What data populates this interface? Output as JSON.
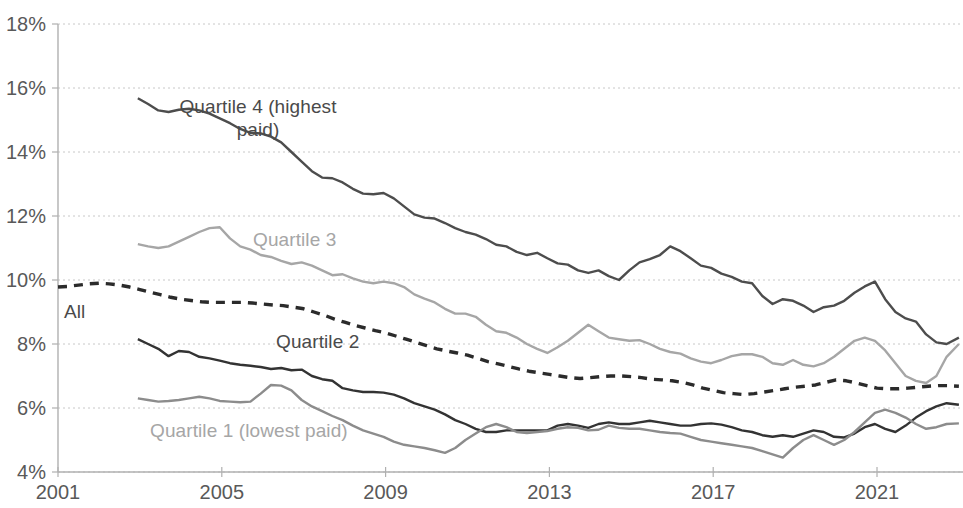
{
  "chart_data": {
    "type": "line",
    "title": "",
    "subtitle": "",
    "xlabel": "",
    "ylabel": "",
    "xlim": [
      2001,
      2023.1
    ],
    "ylim": [
      4,
      18
    ],
    "y_tick_labels": [
      "18%",
      "16%",
      "14%",
      "12%",
      "10%",
      "8%",
      "6%",
      "4%"
    ],
    "y_tick_values": [
      18,
      16,
      14,
      12,
      10,
      8,
      6,
      4
    ],
    "x_tick_labels": [
      "2001",
      "2005",
      "2009",
      "2013",
      "2017",
      "2021"
    ],
    "x_tick_values": [
      2001,
      2005,
      2009,
      2013,
      2017,
      2021
    ],
    "grid": "horizontal-dotted",
    "legend": "inline-labels",
    "colors": {
      "all": "#2b2b2b",
      "quartile_4": "#4d4d4d",
      "quartile_3": "#a6a6a6",
      "quartile_2": "#333333",
      "quartile_1": "#8c8c8c",
      "gridline": "#c8c8c8",
      "axis": "#b0b0b0",
      "tick_text": "#595959",
      "background": "#ffffff"
    },
    "series": [
      {
        "name": "All",
        "label": "All",
        "style": "dashed",
        "color": "#2b2b2b",
        "x": [
          2001,
          2001.25,
          2001.5,
          2001.75,
          2002,
          2002.25,
          2002.5,
          2002.75,
          2003,
          2003.25,
          2003.5,
          2003.75,
          2004,
          2004.25,
          2004.5,
          2004.75,
          2005,
          2005.25,
          2005.5,
          2005.75,
          2006,
          2006.25,
          2006.5,
          2006.75,
          2007,
          2007.25,
          2007.5,
          2007.75,
          2008,
          2008.25,
          2008.5,
          2008.75,
          2009,
          2009.25,
          2009.5,
          2009.75,
          2010,
          2010.25,
          2010.5,
          2010.75,
          2011,
          2011.25,
          2011.5,
          2011.75,
          2012,
          2012.25,
          2012.5,
          2012.75,
          2013,
          2013.25,
          2013.5,
          2013.75,
          2014,
          2014.25,
          2014.5,
          2014.75,
          2015,
          2015.25,
          2015.5,
          2015.75,
          2016,
          2016.25,
          2016.5,
          2016.75,
          2017,
          2017.25,
          2017.5,
          2017.75,
          2018,
          2018.25,
          2018.5,
          2018.75,
          2019,
          2019.25,
          2019.5,
          2019.75,
          2020,
          2020.25,
          2020.5,
          2020.75,
          2021,
          2021.25,
          2021.5,
          2021.75,
          2022,
          2022.25,
          2022.5,
          2022.75,
          2023
        ],
        "y": [
          9.78,
          9.8,
          9.84,
          9.88,
          9.9,
          9.88,
          9.84,
          9.78,
          9.7,
          9.62,
          9.54,
          9.46,
          9.4,
          9.36,
          9.32,
          9.3,
          9.3,
          9.3,
          9.3,
          9.28,
          9.25,
          9.22,
          9.2,
          9.15,
          9.1,
          9.0,
          8.9,
          8.78,
          8.68,
          8.58,
          8.5,
          8.42,
          8.35,
          8.25,
          8.15,
          8.05,
          7.95,
          7.85,
          7.78,
          7.72,
          7.65,
          7.55,
          7.45,
          7.38,
          7.3,
          7.22,
          7.15,
          7.1,
          7.05,
          7.0,
          6.95,
          6.92,
          6.95,
          6.98,
          7.0,
          7.0,
          6.98,
          6.95,
          6.9,
          6.88,
          6.85,
          6.8,
          6.72,
          6.62,
          6.55,
          6.48,
          6.45,
          6.42,
          6.45,
          6.5,
          6.55,
          6.6,
          6.65,
          6.68,
          6.72,
          6.8,
          6.88,
          6.85,
          6.78,
          6.7,
          6.62,
          6.6,
          6.6,
          6.62,
          6.65,
          6.68,
          6.7,
          6.7,
          6.68
        ]
      },
      {
        "name": "Quartile 4 (highest paid)",
        "label": "Quartile 4 (highest\npaid)",
        "style": "solid",
        "color": "#4d4d4d",
        "x": [
          2002.95,
          2003.2,
          2003.45,
          2003.7,
          2003.95,
          2004.2,
          2004.45,
          2004.7,
          2004.95,
          2005.2,
          2005.45,
          2005.7,
          2005.95,
          2006.2,
          2006.45,
          2006.7,
          2006.95,
          2007.2,
          2007.45,
          2007.7,
          2007.95,
          2008.2,
          2008.45,
          2008.7,
          2008.95,
          2009.2,
          2009.45,
          2009.7,
          2009.95,
          2010.2,
          2010.45,
          2010.7,
          2010.95,
          2011.2,
          2011.45,
          2011.7,
          2011.95,
          2012.2,
          2012.45,
          2012.7,
          2012.95,
          2013.2,
          2013.45,
          2013.7,
          2013.95,
          2014.2,
          2014.45,
          2014.7,
          2014.95,
          2015.2,
          2015.45,
          2015.7,
          2015.95,
          2016.2,
          2016.45,
          2016.7,
          2016.95,
          2017.2,
          2017.45,
          2017.7,
          2017.95,
          2018.2,
          2018.45,
          2018.7,
          2018.95,
          2019.2,
          2019.45,
          2019.7,
          2019.95,
          2020.2,
          2020.45,
          2020.7,
          2020.95,
          2021.2,
          2021.45,
          2021.7,
          2021.95,
          2022.2,
          2022.45,
          2022.7,
          2023
        ],
        "y": [
          15.68,
          15.5,
          15.3,
          15.25,
          15.32,
          15.35,
          15.3,
          15.2,
          15.05,
          14.9,
          14.72,
          14.6,
          14.58,
          14.48,
          14.3,
          14.0,
          13.7,
          13.4,
          13.2,
          13.18,
          13.05,
          12.85,
          12.7,
          12.68,
          12.72,
          12.55,
          12.3,
          12.05,
          11.95,
          11.92,
          11.78,
          11.62,
          11.5,
          11.42,
          11.28,
          11.1,
          11.05,
          10.88,
          10.78,
          10.85,
          10.68,
          10.52,
          10.48,
          10.3,
          10.22,
          10.3,
          10.12,
          10.0,
          10.3,
          10.55,
          10.65,
          10.78,
          11.05,
          10.9,
          10.68,
          10.45,
          10.38,
          10.2,
          10.1,
          9.95,
          9.9,
          9.5,
          9.25,
          9.4,
          9.35,
          9.2,
          9.0,
          9.15,
          9.2,
          9.35,
          9.6,
          9.8,
          9.95,
          9.4,
          9.0,
          8.8,
          8.7,
          8.3,
          8.05,
          8.0,
          8.2
        ]
      },
      {
        "name": "Quartile 3",
        "label": "Quartile 3",
        "style": "solid",
        "color": "#a6a6a6",
        "x": [
          2002.95,
          2003.2,
          2003.45,
          2003.7,
          2003.95,
          2004.2,
          2004.45,
          2004.7,
          2004.95,
          2005.2,
          2005.45,
          2005.7,
          2005.95,
          2006.2,
          2006.45,
          2006.7,
          2006.95,
          2007.2,
          2007.45,
          2007.7,
          2007.95,
          2008.2,
          2008.45,
          2008.7,
          2008.95,
          2009.2,
          2009.45,
          2009.7,
          2009.95,
          2010.2,
          2010.45,
          2010.7,
          2010.95,
          2011.2,
          2011.45,
          2011.7,
          2011.95,
          2012.2,
          2012.45,
          2012.7,
          2012.95,
          2013.2,
          2013.45,
          2013.7,
          2013.95,
          2014.2,
          2014.45,
          2014.7,
          2014.95,
          2015.2,
          2015.45,
          2015.7,
          2015.95,
          2016.2,
          2016.45,
          2016.7,
          2016.95,
          2017.2,
          2017.45,
          2017.7,
          2017.95,
          2018.2,
          2018.45,
          2018.7,
          2018.95,
          2019.2,
          2019.45,
          2019.7,
          2019.95,
          2020.2,
          2020.45,
          2020.7,
          2020.95,
          2021.2,
          2021.45,
          2021.7,
          2021.95,
          2022.2,
          2022.45,
          2022.7,
          2023
        ],
        "y": [
          11.12,
          11.05,
          11.0,
          11.05,
          11.2,
          11.35,
          11.5,
          11.62,
          11.65,
          11.3,
          11.05,
          10.95,
          10.78,
          10.72,
          10.6,
          10.5,
          10.55,
          10.45,
          10.3,
          10.15,
          10.18,
          10.05,
          9.95,
          9.9,
          9.95,
          9.9,
          9.78,
          9.55,
          9.42,
          9.3,
          9.1,
          8.95,
          8.95,
          8.85,
          8.6,
          8.4,
          8.35,
          8.2,
          8.0,
          7.85,
          7.72,
          7.9,
          8.1,
          8.35,
          8.6,
          8.4,
          8.2,
          8.15,
          8.1,
          8.12,
          8.0,
          7.85,
          7.75,
          7.7,
          7.55,
          7.45,
          7.4,
          7.5,
          7.62,
          7.68,
          7.68,
          7.6,
          7.4,
          7.35,
          7.5,
          7.35,
          7.3,
          7.4,
          7.6,
          7.85,
          8.1,
          8.2,
          8.1,
          7.8,
          7.4,
          7.0,
          6.85,
          6.78,
          7.0,
          7.6,
          8.0
        ]
      },
      {
        "name": "Quartile 2",
        "label": "Quartile 2",
        "style": "solid",
        "color": "#333333",
        "x": [
          2002.95,
          2003.2,
          2003.45,
          2003.7,
          2003.95,
          2004.2,
          2004.45,
          2004.7,
          2004.95,
          2005.2,
          2005.45,
          2005.7,
          2005.95,
          2006.2,
          2006.45,
          2006.7,
          2006.95,
          2007.2,
          2007.45,
          2007.7,
          2007.95,
          2008.2,
          2008.45,
          2008.7,
          2008.95,
          2009.2,
          2009.45,
          2009.7,
          2009.95,
          2010.2,
          2010.45,
          2010.7,
          2010.95,
          2011.2,
          2011.45,
          2011.7,
          2011.95,
          2012.2,
          2012.45,
          2012.7,
          2012.95,
          2013.2,
          2013.45,
          2013.7,
          2013.95,
          2014.2,
          2014.45,
          2014.7,
          2014.95,
          2015.2,
          2015.45,
          2015.7,
          2015.95,
          2016.2,
          2016.45,
          2016.7,
          2016.95,
          2017.2,
          2017.45,
          2017.7,
          2017.95,
          2018.2,
          2018.45,
          2018.7,
          2018.95,
          2019.2,
          2019.45,
          2019.7,
          2019.95,
          2020.2,
          2020.45,
          2020.7,
          2020.95,
          2021.2,
          2021.45,
          2021.7,
          2021.95,
          2022.2,
          2022.45,
          2022.7,
          2023
        ],
        "y": [
          8.15,
          8.0,
          7.85,
          7.62,
          7.78,
          7.75,
          7.6,
          7.55,
          7.48,
          7.4,
          7.35,
          7.32,
          7.28,
          7.22,
          7.25,
          7.18,
          7.2,
          7.0,
          6.9,
          6.85,
          6.62,
          6.55,
          6.5,
          6.5,
          6.48,
          6.42,
          6.3,
          6.15,
          6.05,
          5.95,
          5.8,
          5.62,
          5.5,
          5.35,
          5.25,
          5.25,
          5.3,
          5.3,
          5.3,
          5.3,
          5.3,
          5.45,
          5.5,
          5.45,
          5.38,
          5.5,
          5.55,
          5.5,
          5.5,
          5.55,
          5.6,
          5.55,
          5.5,
          5.45,
          5.45,
          5.5,
          5.52,
          5.48,
          5.4,
          5.3,
          5.25,
          5.15,
          5.1,
          5.15,
          5.1,
          5.2,
          5.3,
          5.25,
          5.1,
          5.08,
          5.2,
          5.4,
          5.5,
          5.35,
          5.25,
          5.45,
          5.7,
          5.9,
          6.05,
          6.15,
          6.1
        ]
      },
      {
        "name": "Quartile 1 (lowest paid)",
        "label": "Quartile 1 (lowest paid)",
        "style": "solid",
        "color": "#8c8c8c",
        "x": [
          2002.95,
          2003.2,
          2003.45,
          2003.7,
          2003.95,
          2004.2,
          2004.45,
          2004.7,
          2004.95,
          2005.2,
          2005.45,
          2005.7,
          2005.95,
          2006.2,
          2006.45,
          2006.7,
          2006.95,
          2007.2,
          2007.45,
          2007.7,
          2007.95,
          2008.2,
          2008.45,
          2008.7,
          2008.95,
          2009.2,
          2009.45,
          2009.7,
          2009.95,
          2010.2,
          2010.45,
          2010.7,
          2010.95,
          2011.2,
          2011.45,
          2011.7,
          2011.95,
          2012.2,
          2012.45,
          2012.7,
          2012.95,
          2013.2,
          2013.45,
          2013.7,
          2013.95,
          2014.2,
          2014.45,
          2014.7,
          2014.95,
          2015.2,
          2015.45,
          2015.7,
          2015.95,
          2016.2,
          2016.45,
          2016.7,
          2016.95,
          2017.2,
          2017.45,
          2017.7,
          2017.95,
          2018.2,
          2018.45,
          2018.7,
          2018.95,
          2019.2,
          2019.45,
          2019.7,
          2019.95,
          2020.2,
          2020.45,
          2020.7,
          2020.95,
          2021.2,
          2021.45,
          2021.7,
          2021.95,
          2022.2,
          2022.45,
          2022.7,
          2023
        ],
        "y": [
          6.3,
          6.25,
          6.2,
          6.22,
          6.25,
          6.3,
          6.35,
          6.3,
          6.22,
          6.2,
          6.18,
          6.2,
          6.45,
          6.72,
          6.7,
          6.55,
          6.25,
          6.05,
          5.9,
          5.75,
          5.62,
          5.45,
          5.3,
          5.2,
          5.1,
          4.95,
          4.85,
          4.8,
          4.75,
          4.68,
          4.6,
          4.75,
          5.0,
          5.2,
          5.4,
          5.5,
          5.4,
          5.25,
          5.22,
          5.25,
          5.28,
          5.35,
          5.4,
          5.38,
          5.3,
          5.32,
          5.45,
          5.38,
          5.35,
          5.35,
          5.3,
          5.25,
          5.22,
          5.2,
          5.1,
          5.0,
          4.95,
          4.9,
          4.85,
          4.8,
          4.75,
          4.65,
          4.55,
          4.45,
          4.75,
          5.0,
          5.15,
          5.0,
          4.85,
          5.0,
          5.25,
          5.55,
          5.85,
          5.95,
          5.85,
          5.7,
          5.5,
          5.35,
          5.4,
          5.5,
          5.52
        ]
      }
    ],
    "annotations": [
      {
        "name": "label-all",
        "text": "All",
        "x_px": 64,
        "y_px": 300,
        "color_kind": "dark",
        "align": "left"
      },
      {
        "name": "label-quartile-4",
        "text": "Quartile 4 (highest\npaid)",
        "x_px": 258,
        "y_px": 95,
        "color_kind": "dark",
        "align": "center"
      },
      {
        "name": "label-quartile-3",
        "text": "Quartile 3",
        "x_px": 253,
        "y_px": 228,
        "color_kind": "light",
        "align": "left"
      },
      {
        "name": "label-quartile-2",
        "text": "Quartile 2",
        "x_px": 276,
        "y_px": 330,
        "color_kind": "dark",
        "align": "left"
      },
      {
        "name": "label-quartile-1",
        "text": "Quartile 1 (lowest paid)",
        "x_px": 150,
        "y_px": 419,
        "color_kind": "light",
        "align": "left"
      }
    ]
  }
}
